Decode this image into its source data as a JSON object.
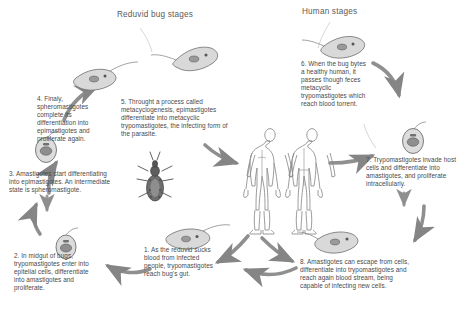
{
  "diagram": {
    "title_left": "Reduvid bug stages",
    "title_right": "Human stages",
    "ink": "#4a4a4a",
    "arrow_color": "#8c8c8c",
    "background": "#ffffff"
  },
  "steps": [
    {
      "number": "1",
      "text": "1. As the reduvid sucks blood from infected people, trypomastigotes reach bug's gut."
    },
    {
      "number": "2",
      "text": "2. In midgut of bugs, trypomastigotes enter into epitelial cells, differentiate into amastigotes and proliferate."
    },
    {
      "number": "3",
      "text": "3. Amastigotes start differentiating into epimastigotes. An intermediate state is spheromastigote."
    },
    {
      "number": "4",
      "text": "4. Finaly, spheromastigotes complete its differentiation into epimastigotes and proliferate again."
    },
    {
      "number": "5",
      "text": "5. Throught a process called metacyclogenesis, epimastigotes differentiate into metacyclic trypomastigotes, the infecting form of the parasite."
    },
    {
      "number": "6",
      "text": "6. When the bug bytes a healthy human, it passes though feces metacyclic trypomastigotes which reach blood torrent."
    },
    {
      "number": "7",
      "text": "7. Trypomastigotes invade host cells and differentiate into amastigotes, and proliferate intracellularly."
    },
    {
      "number": "8",
      "text": "8. Amastigotes can escape from cells, differentiate into trypomastigotes and reach again blood stream, being capable of infecting new cells."
    }
  ],
  "organisms": [
    {
      "name": "trypomastigote-step1",
      "form": "trypomastigote"
    },
    {
      "name": "amastigote-step2",
      "form": "amastigote"
    },
    {
      "name": "amastigote-step3",
      "form": "amastigote"
    },
    {
      "name": "epimastigote-step4",
      "form": "epimastigote"
    },
    {
      "name": "epimastigote-step5",
      "form": "epimastigote"
    },
    {
      "name": "trypomastigote-step6",
      "form": "trypomastigote"
    },
    {
      "name": "amastigote-step7",
      "form": "amastigote"
    },
    {
      "name": "trypomastigote-step8",
      "form": "trypomastigote"
    },
    {
      "name": "reduviid-bug",
      "form": "insect"
    },
    {
      "name": "human-body-front",
      "form": "human"
    },
    {
      "name": "human-body-back",
      "form": "human"
    }
  ]
}
